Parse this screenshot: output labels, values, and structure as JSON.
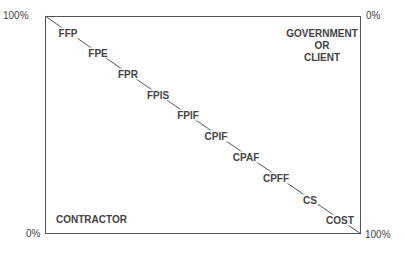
{
  "axes": {
    "left_top": "100%",
    "left_bottom": "0%",
    "right_top": "0%",
    "right_bottom": "100%"
  },
  "corners": {
    "top_right": [
      "GOVERNMENT",
      "OR",
      "CLIENT"
    ],
    "bottom_left": "CONTRACTOR"
  },
  "contract_types": [
    {
      "label": "FFP",
      "x": 68,
      "y": 33
    },
    {
      "label": "FPE",
      "x": 98,
      "y": 53
    },
    {
      "label": "FPR",
      "x": 128,
      "y": 74
    },
    {
      "label": "FPIS",
      "x": 158,
      "y": 95
    },
    {
      "label": "FPIF",
      "x": 188,
      "y": 115
    },
    {
      "label": "CPIF",
      "x": 216,
      "y": 136
    },
    {
      "label": "CPAF",
      "x": 246,
      "y": 157
    },
    {
      "label": "CPFF",
      "x": 276,
      "y": 178
    },
    {
      "label": "CS",
      "x": 310,
      "y": 200
    },
    {
      "label": "COST",
      "x": 340,
      "y": 220
    }
  ],
  "colors": {
    "line": "#555555",
    "text": "#444444"
  }
}
